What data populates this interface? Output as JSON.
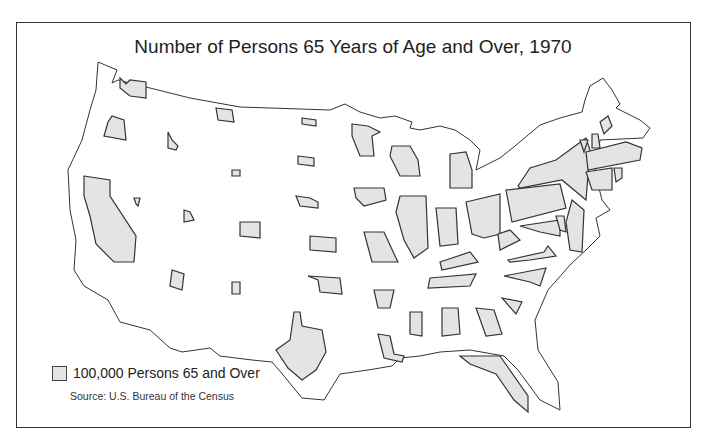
{
  "title": "Number of Persons 65 Years of Age and Over, 1970",
  "legend": {
    "label": "100,000 Persons 65 and Over",
    "swatch_color": "#e4e4e4"
  },
  "source": "Source: U.S. Bureau of the Census",
  "colors": {
    "state_fill": "#e4e4e4",
    "outline": "#333333",
    "background": "#ffffff"
  },
  "states_shown": [
    "Washington",
    "Oregon",
    "California",
    "Idaho",
    "Nevada",
    "Utah",
    "Arizona",
    "Montana",
    "Wyoming",
    "Colorado",
    "New Mexico",
    "North Dakota",
    "South Dakota",
    "Nebraska",
    "Kansas",
    "Oklahoma",
    "Texas",
    "Minnesota",
    "Iowa",
    "Missouri",
    "Arkansas",
    "Louisiana",
    "Wisconsin",
    "Illinois",
    "Michigan",
    "Indiana",
    "Ohio",
    "Kentucky",
    "Tennessee",
    "Mississippi",
    "Alabama",
    "Georgia",
    "Florida",
    "South Carolina",
    "North Carolina",
    "Virginia",
    "West Virginia",
    "Maryland",
    "Delaware",
    "Pennsylvania",
    "New Jersey",
    "New York",
    "Connecticut",
    "Rhode Island",
    "Massachusetts",
    "Vermont",
    "New Hampshire",
    "Maine"
  ]
}
